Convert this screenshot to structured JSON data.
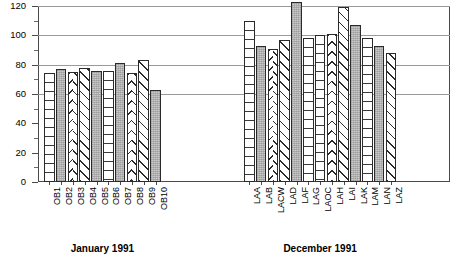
{
  "chart_data": {
    "type": "bar",
    "title": "",
    "subtitle": "",
    "xlabel": "",
    "ylabel": "",
    "ylim": [
      0,
      120
    ],
    "y_ticks_major": [
      0,
      20,
      40,
      60,
      80,
      100,
      120
    ],
    "y_ticks_minor": [
      10,
      30,
      50,
      70,
      90,
      110
    ],
    "y_tick_labels": [
      "0",
      "20",
      "40",
      "60",
      "80",
      "100",
      "120"
    ],
    "gridlines": [
      60,
      80,
      100,
      120
    ],
    "grid": true,
    "legend": "none",
    "groups": [
      {
        "caption": "January 1991",
        "categories": [
          "OB1",
          "OB2",
          "OB3",
          "OB4",
          "OB5",
          "OB6",
          "OB7",
          "OB8",
          "OB9",
          "OB10"
        ],
        "values": [
          74,
          77,
          75,
          78,
          76,
          76,
          81,
          74,
          83,
          63
        ],
        "patterns": [
          "hlines",
          "stipple",
          "chevron",
          "diag",
          "stipple",
          "hlines",
          "stipple",
          "chevron",
          "diag",
          "stipple"
        ]
      },
      {
        "caption": "December 1991",
        "categories": [
          "LAA",
          "LAB",
          "LACW",
          "LAD",
          "LAF",
          "LAG",
          "LAOC",
          "LAH",
          "LAI",
          "LAK",
          "LAM",
          "LAN",
          "LAZ"
        ],
        "values": [
          110,
          93,
          91,
          97,
          123,
          98,
          100,
          101,
          119,
          107,
          98,
          93,
          88
        ],
        "patterns": [
          "hlines",
          "stipple",
          "chevron",
          "diag",
          "stipple",
          "hlines",
          "hlines",
          "chevron",
          "diag",
          "stipple",
          "hlines",
          "stipple",
          "diag"
        ]
      }
    ]
  },
  "axis": {
    "y_label_0": "0",
    "y_label_20": "20",
    "y_label_40": "40",
    "y_label_60": "60",
    "y_label_80": "80",
    "y_label_100": "100",
    "y_label_120": "120"
  }
}
